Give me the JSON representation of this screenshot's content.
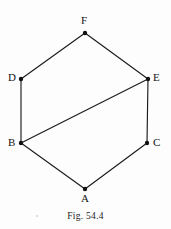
{
  "figure": {
    "caption": "Fig. 54.4",
    "canvas": {
      "width": 171,
      "height": 229
    },
    "stroke_color": "#1c1c1c",
    "vertex_color": "#111111",
    "background_color": "#fdfdfd",
    "vertices": [
      {
        "id": "F",
        "label": "F",
        "x": 85,
        "y": 33,
        "label_x": 81,
        "label_y": 15
      },
      {
        "id": "D",
        "label": "D",
        "x": 21,
        "y": 79,
        "label_x": 8,
        "label_y": 72
      },
      {
        "id": "E",
        "label": "E",
        "x": 148,
        "y": 79,
        "label_x": 153,
        "label_y": 72
      },
      {
        "id": "B",
        "label": "B",
        "x": 21,
        "y": 143,
        "label_x": 8,
        "label_y": 137
      },
      {
        "id": "C",
        "label": "C",
        "x": 147,
        "y": 143,
        "label_x": 153,
        "label_y": 137
      },
      {
        "id": "A",
        "label": "A",
        "x": 85,
        "y": 189,
        "label_x": 81,
        "label_y": 193
      }
    ],
    "edges": [
      {
        "name": "edge-D-F",
        "from": "D",
        "to": "F"
      },
      {
        "name": "edge-F-E",
        "from": "F",
        "to": "E"
      },
      {
        "name": "edge-E-C",
        "from": "E",
        "to": "C"
      },
      {
        "name": "edge-C-A",
        "from": "C",
        "to": "A"
      },
      {
        "name": "edge-A-B",
        "from": "A",
        "to": "B"
      },
      {
        "name": "edge-B-D",
        "from": "B",
        "to": "D"
      },
      {
        "name": "diagonal-B-E",
        "from": "B",
        "to": "E"
      }
    ]
  }
}
